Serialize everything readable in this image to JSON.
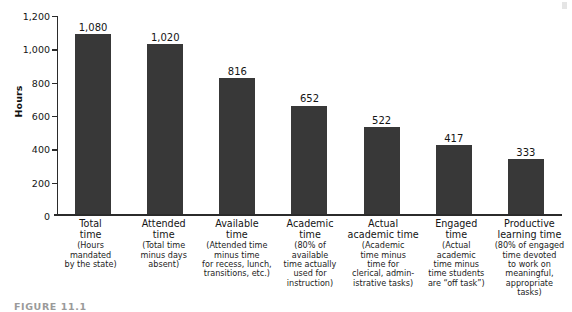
{
  "figure": {
    "caption": "FIGURE 11.1"
  },
  "chart_data": {
    "type": "bar",
    "title": "",
    "xlabel": "",
    "ylabel": "Hours",
    "ylim": [
      0,
      1200
    ],
    "yticks": [
      0,
      200,
      400,
      600,
      800,
      1000,
      1200
    ],
    "ytick_labels": [
      "0",
      "200",
      "400",
      "600",
      "800",
      "1,000",
      "1,200"
    ],
    "grid": false,
    "legend": "none",
    "bar_color": "#383838",
    "categories": [
      "Total time",
      "Attended time",
      "Available time",
      "Academic time",
      "Actual academic time",
      "Engaged time",
      "Productive learning time"
    ],
    "values": [
      1080,
      1020,
      816,
      652,
      522,
      417,
      333
    ],
    "value_labels": [
      "1,080",
      "1,020",
      "816",
      "652",
      "522",
      "417",
      "333"
    ],
    "bars": [
      {
        "title": "Total\ntime",
        "title_lines": [
          "Total",
          "time"
        ],
        "sub_lines": [
          "(Hours",
          "mandated",
          "by the state)"
        ],
        "value": 1080,
        "value_label": "1,080"
      },
      {
        "title": "Attended\ntime",
        "title_lines": [
          "Attended",
          "time"
        ],
        "sub_lines": [
          "(Total time",
          "minus days",
          "absent)"
        ],
        "value": 1020,
        "value_label": "1,020"
      },
      {
        "title": "Available\ntime",
        "title_lines": [
          "Available",
          "time"
        ],
        "sub_lines": [
          "(Attended time",
          "minus time",
          "for recess, lunch,",
          "transitions, etc.)"
        ],
        "value": 816,
        "value_label": "816"
      },
      {
        "title": "Academic\ntime",
        "title_lines": [
          "Academic",
          "time"
        ],
        "sub_lines": [
          "(80% of",
          "available",
          "time actually",
          "used for",
          "instruction)"
        ],
        "value": 652,
        "value_label": "652"
      },
      {
        "title": "Actual\nacademic time",
        "title_lines": [
          "Actual",
          "academic time"
        ],
        "sub_lines": [
          "(Academic",
          "time minus",
          "time for",
          "clerical, admin-",
          "istrative tasks)"
        ],
        "value": 522,
        "value_label": "522"
      },
      {
        "title": "Engaged\ntime",
        "title_lines": [
          "Engaged",
          "time"
        ],
        "sub_lines": [
          "(Actual",
          "academic",
          "time minus",
          "time students",
          "are “off task”)"
        ],
        "value": 417,
        "value_label": "417"
      },
      {
        "title": "Productive\nlearning time",
        "title_lines": [
          "Productive",
          "learning time"
        ],
        "sub_lines": [
          "(80% of engaged",
          "time devoted",
          "to work on",
          "meaningful,",
          "appropriate tasks)"
        ],
        "value": 333,
        "value_label": "333"
      }
    ]
  }
}
